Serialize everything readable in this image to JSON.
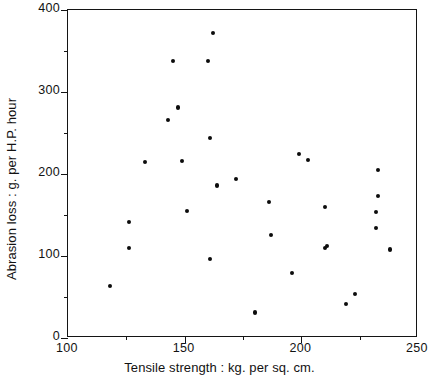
{
  "chart_data": {
    "type": "scatter",
    "title": "",
    "xlabel": "Tensile strength : kg. per sq. cm.",
    "ylabel": "Abrasion loss : g. per H.P. hour",
    "xlim": [
      100,
      250
    ],
    "ylim": [
      0,
      400
    ],
    "xticks": [
      100,
      150,
      200,
      250
    ],
    "xtick_labels": [
      "100",
      "150",
      "200",
      "250"
    ],
    "xticks_minor": [
      125,
      175,
      225
    ],
    "yticks": [
      0,
      100,
      200,
      300,
      400
    ],
    "ytick_labels": [
      "0",
      "100",
      "200",
      "300",
      "400"
    ],
    "yticks_minor": [
      50,
      150,
      250,
      350
    ],
    "grid": false,
    "legend": null,
    "marker": "filled-circle",
    "marker_color": "#0c0c0c",
    "points": [
      {
        "x": 118,
        "y": 63
      },
      {
        "x": 126,
        "y": 110
      },
      {
        "x": 126,
        "y": 141
      },
      {
        "x": 133,
        "y": 215
      },
      {
        "x": 143,
        "y": 266
      },
      {
        "x": 145,
        "y": 338
      },
      {
        "x": 147,
        "y": 281
      },
      {
        "x": 149,
        "y": 216
      },
      {
        "x": 151,
        "y": 155
      },
      {
        "x": 160,
        "y": 338
      },
      {
        "x": 161,
        "y": 96
      },
      {
        "x": 161,
        "y": 244
      },
      {
        "x": 162,
        "y": 372
      },
      {
        "x": 164,
        "y": 186
      },
      {
        "x": 172,
        "y": 194
      },
      {
        "x": 180,
        "y": 31
      },
      {
        "x": 186,
        "y": 166
      },
      {
        "x": 187,
        "y": 126
      },
      {
        "x": 199,
        "y": 224
      },
      {
        "x": 196,
        "y": 79
      },
      {
        "x": 203,
        "y": 217
      },
      {
        "x": 210,
        "y": 110
      },
      {
        "x": 210,
        "y": 160
      },
      {
        "x": 211,
        "y": 112
      },
      {
        "x": 219,
        "y": 41
      },
      {
        "x": 223,
        "y": 54
      },
      {
        "x": 233,
        "y": 173
      },
      {
        "x": 233,
        "y": 205
      },
      {
        "x": 232,
        "y": 134
      },
      {
        "x": 232,
        "y": 154
      },
      {
        "x": 238,
        "y": 108
      }
    ]
  }
}
